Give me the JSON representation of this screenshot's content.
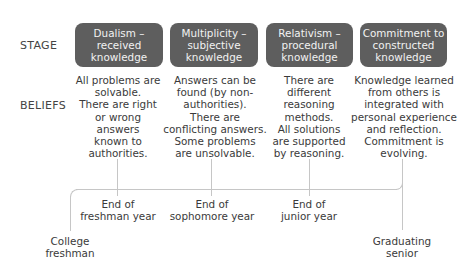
{
  "row_labels": {
    "stage": "STAGE",
    "beliefs": "BELIEFS"
  },
  "stages": [
    {
      "title": "Dualism –\nreceived\nknowledge",
      "beliefs": "All problems are\nsolvable.\nThere are right\nor wrong\nanswers\nknown to\nauthorities."
    },
    {
      "title": "Multiplicity –\nsubjective\nknowledge",
      "beliefs": "Answers can be\nfound (by non-\nauthorities).\nThere are\nconflicting answers.\nSome problems\nare unsolvable."
    },
    {
      "title": "Relativism –\nprocedural\nknowledge",
      "beliefs": "There are\ndifferent\nreasoning\nmethods.\nAll solutions\nare supported\nby reasoning."
    },
    {
      "title": "Commitment to\nconstructed\nknowledge",
      "beliefs": "Knowledge learned\nfrom others is\nintegrated with\npersonal experience\nand reflection.\nCommitment is\nevolving."
    }
  ],
  "timeline": {
    "start": "College\nfreshman",
    "milestones": [
      "End of\nfreshman year",
      "End of\nsophomore year",
      "End of\njunior year"
    ],
    "end": "Graduating\nsenior"
  },
  "colors": {
    "box": "#5e5e5e",
    "box_text": "#f2f2f2",
    "line": "#c6c6c6",
    "text": "#3a3a3a"
  }
}
